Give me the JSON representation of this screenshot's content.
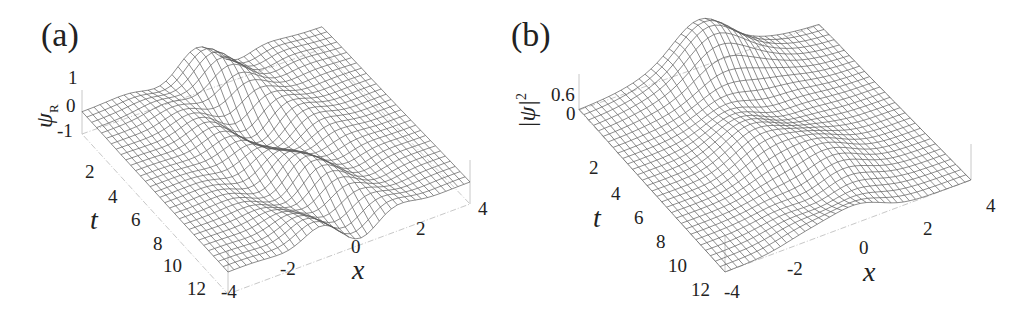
{
  "figure": {
    "panels": [
      {
        "id": "a",
        "tag": "(a)",
        "zlabel_main": "ψ",
        "zlabel_sub": "R",
        "zlabel_sup": "",
        "zticks": [
          "1",
          "0",
          "-1"
        ],
        "tticks": [
          "2",
          "4",
          "6",
          "8",
          "10",
          "12"
        ],
        "xticks": [
          "-4",
          "-2",
          "0",
          "2",
          "4"
        ],
        "tlabel": "t",
        "xlabel": "x"
      },
      {
        "id": "b",
        "tag": "(b)",
        "zlabel_main": "|ψ|",
        "zlabel_sub": "",
        "zlabel_sup": "2",
        "zticks": [
          "0.6",
          "0"
        ],
        "tticks": [
          "2",
          "4",
          "6",
          "8",
          "10",
          "12"
        ],
        "xticks": [
          "-4",
          "-2",
          "0",
          "2",
          "4"
        ],
        "tlabel": "t",
        "xlabel": "x"
      }
    ],
    "colors": {
      "mesh": "#5a5a5a",
      "box": "#c8c8c8",
      "text": "#222222",
      "background": "#ffffff"
    }
  },
  "chart_data": [
    {
      "type": "surface",
      "title": "(a)",
      "xlabel": "x",
      "ylabel": "t",
      "zlabel": "ψ_R",
      "x_range": [
        -4,
        4
      ],
      "t_range": [
        0,
        12
      ],
      "z_range": [
        -1,
        1
      ],
      "x_ticks": [
        -4,
        -2,
        0,
        2,
        4
      ],
      "t_ticks": [
        2,
        4,
        6,
        8,
        10,
        12
      ],
      "z_ticks": [
        -1,
        0,
        1
      ],
      "grid": false,
      "mesh": {
        "x_lines": 40,
        "t_lines": 30
      },
      "description": "Wireframe of the real part of ψ over (x,t); localized oscillating wave structure centered near x≈0 with crossing ridges around t≈4–8, flat (≈0) toward |x|=4."
    },
    {
      "type": "surface",
      "title": "(b)",
      "xlabel": "x",
      "ylabel": "t",
      "zlabel": "|ψ|^2",
      "x_range": [
        -4,
        4
      ],
      "t_range": [
        0,
        12
      ],
      "z_range": [
        0,
        0.6
      ],
      "x_ticks": [
        -4,
        -2,
        0,
        2,
        4
      ],
      "t_ticks": [
        2,
        4,
        6,
        8,
        10,
        12
      ],
      "z_ticks": [
        0,
        0.6
      ],
      "grid": false,
      "mesh": {
        "x_lines": 40,
        "t_lines": 30
      },
      "description": "Wireframe of the density |ψ|^2 over (x,t); smooth localized hump near x≈0 with slight modulation along t, decaying to 0 toward |x|=4."
    }
  ]
}
